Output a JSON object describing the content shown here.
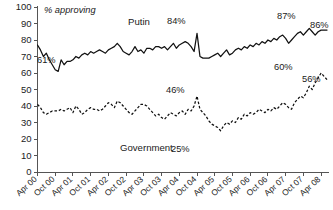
{
  "chart_data": {
    "type": "line",
    "title": "",
    "subtitle": "",
    "ylabel": "% approving",
    "xlabel": "",
    "ylim": [
      0,
      100
    ],
    "ytick_step": 10,
    "yticks": [
      "0",
      "10",
      "20",
      "30",
      "40",
      "50",
      "60",
      "70",
      "80",
      "90",
      "100"
    ],
    "grid": false,
    "legend_position": "inline-annotations",
    "xticks": [
      "Apr 00",
      "Oct 00",
      "Apr 01",
      "Oct 01",
      "Apr 02",
      "Oct 02",
      "Apr 03",
      "Oct 03",
      "Apr 04",
      "Oct 04",
      "Apr 05",
      "Oct 05",
      "Apr 06",
      "Oct 06",
      "Apr 07",
      "Oct 07",
      "Apr 08"
    ],
    "x_start": "Apr 00",
    "x_end": "Apr 08",
    "x_interval_months": 1,
    "series": [
      {
        "name": "Putin",
        "style": "solid",
        "color": "#111111",
        "values": [
          77,
          74,
          70,
          72,
          68,
          65,
          62,
          61,
          68,
          65,
          67,
          67,
          68,
          70,
          69,
          71,
          72,
          71,
          73,
          72,
          73,
          74,
          73,
          72,
          74,
          75,
          76,
          78,
          76,
          73,
          72,
          71,
          73,
          76,
          73,
          74,
          72,
          75,
          75,
          74,
          76,
          76,
          75,
          76,
          74,
          76,
          78,
          75,
          77,
          78,
          79,
          78,
          76,
          73,
          84,
          70,
          69,
          69,
          69,
          70,
          71,
          72,
          70,
          72,
          74,
          71,
          72,
          74,
          75,
          74,
          76,
          75,
          77,
          76,
          78,
          77,
          79,
          78,
          80,
          79,
          81,
          80,
          82,
          83,
          81,
          78,
          80,
          82,
          84,
          85,
          83,
          85,
          87,
          85,
          83,
          85,
          86,
          86,
          86
        ]
      },
      {
        "name": "Government",
        "style": "dashed",
        "color": "#111111",
        "values": [
          41,
          39,
          36,
          35,
          36,
          37,
          37,
          37,
          38,
          37,
          38,
          39,
          36,
          40,
          38,
          35,
          36,
          38,
          39,
          38,
          38,
          37,
          38,
          40,
          42,
          41,
          39,
          43,
          42,
          40,
          38,
          36,
          35,
          37,
          39,
          41,
          41,
          40,
          38,
          36,
          34,
          35,
          33,
          32,
          34,
          36,
          35,
          34,
          36,
          37,
          35,
          38,
          37,
          40,
          46,
          38,
          36,
          34,
          31,
          29,
          28,
          27,
          25,
          28,
          30,
          29,
          31,
          30,
          33,
          32,
          35,
          34,
          36,
          35,
          36,
          38,
          37,
          36,
          38,
          37,
          39,
          38,
          40,
          42,
          41,
          39,
          38,
          42,
          44,
          46,
          45,
          48,
          52,
          50,
          54,
          57,
          60,
          58,
          56
        ]
      }
    ],
    "annotations": [
      {
        "text": "Putin",
        "x_px": 128,
        "y_px": 25,
        "name": "putin-series-label"
      },
      {
        "text": "Government",
        "x_px": 120,
        "y_px": 151,
        "name": "government-series-label"
      },
      {
        "text": "61%",
        "x_px": 37,
        "y_px": 63,
        "name": "putin-min-label"
      },
      {
        "text": "84%",
        "x_px": 167,
        "y_px": 24,
        "name": "putin-spike-label"
      },
      {
        "text": "87%",
        "x_px": 277,
        "y_px": 19,
        "name": "putin-peak-label"
      },
      {
        "text": "86%",
        "x_px": 310,
        "y_px": 28,
        "name": "putin-end-label"
      },
      {
        "text": "46%",
        "x_px": 166,
        "y_px": 93,
        "name": "government-spike-label"
      },
      {
        "text": "25%",
        "x_px": 171,
        "y_px": 152,
        "name": "government-min-label"
      },
      {
        "text": "60%",
        "x_px": 274,
        "y_px": 70,
        "name": "government-peak-label"
      },
      {
        "text": "56%",
        "x_px": 302,
        "y_px": 82,
        "name": "government-end-label"
      }
    ]
  },
  "colors": {
    "background": "#ffffff",
    "axis": "#555555",
    "ink": "#111111"
  }
}
